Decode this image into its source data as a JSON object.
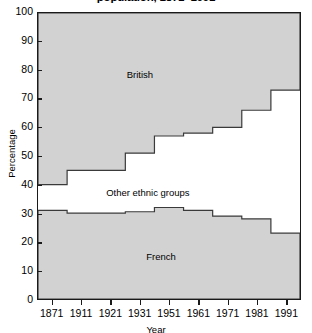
{
  "chart_data": {
    "type": "area",
    "title": "population, 1871–1991",
    "xlabel": "Year",
    "ylabel": "Percentage",
    "ylim": [
      0,
      100
    ],
    "ytick_step": 10,
    "yticks": [
      0,
      10,
      20,
      30,
      40,
      50,
      60,
      70,
      80,
      90,
      100
    ],
    "xlim": [
      1871,
      1991
    ],
    "xticks": [
      1871,
      1911,
      1921,
      1931,
      1951,
      1961,
      1971,
      1981,
      1991
    ],
    "xtick_labels": [
      "1871",
      "1911",
      "1921",
      "1931",
      "1951",
      "1961",
      "1971",
      "1981",
      "1991"
    ],
    "grid": false,
    "legend": "in-plot labels",
    "stacked": true,
    "step_style": "post",
    "x": [
      1871,
      1911,
      1921,
      1931,
      1951,
      1961,
      1971,
      1981,
      1991
    ],
    "series": [
      {
        "name": "French",
        "label": "French",
        "values": [
          31,
          30,
          30,
          30.5,
          32,
          31,
          29,
          28,
          23
        ],
        "boundary_note": "upper edge of bottom band; band spans 0 to value",
        "fill": "#d2d2d2"
      },
      {
        "name": "Other ethnic groups",
        "label": "Other ethnic groups",
        "values": [
          29,
          25,
          25,
          18.5,
          11,
          11,
          11,
          6,
          4
        ],
        "boundary_note": "unfilled middle band between French top and British bottom",
        "fill": "#ffffff"
      },
      {
        "name": "British",
        "label": "British",
        "values": [
          60,
          55,
          55,
          49,
          43,
          42,
          40,
          34,
          27
        ],
        "boundary_note": "top band; lower edge at 40,45,45,51,57,58,60,66,73 rising to 100",
        "fill": "#d2d2d2"
      }
    ],
    "british_lower_edge": [
      40,
      45,
      45,
      51,
      57,
      58,
      60,
      66,
      73
    ],
    "french_upper_edge": [
      31,
      30,
      30,
      30.5,
      32,
      31,
      29,
      28,
      23
    ],
    "annotations": [
      {
        "text": "British",
        "x_frac": 0.39,
        "y_value": 78
      },
      {
        "text": "Other ethnic groups",
        "x_frac": 0.42,
        "y_value": 37
      },
      {
        "text": "French",
        "x_frac": 0.47,
        "y_value": 15
      }
    ],
    "colors": {
      "band_fill": "#d2d2d2",
      "band_stroke": "#3a3a3a",
      "frame": "#1a1a1a",
      "text": "#000000",
      "background": "#ffffff"
    }
  }
}
